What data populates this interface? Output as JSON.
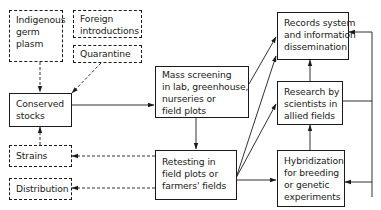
{
  "diagram": {
    "type": "flowchart",
    "nodes": {
      "indigenous": {
        "style": "dashed",
        "lines": [
          "Indigenous",
          "germ",
          "plasm"
        ]
      },
      "foreign": {
        "style": "dashed",
        "lines": [
          "Foreign",
          "introductions"
        ]
      },
      "quarantine": {
        "style": "dashed",
        "lines": [
          "Quarantine"
        ]
      },
      "conserved": {
        "style": "solid",
        "lines": [
          "Conserved",
          "stocks"
        ]
      },
      "strains": {
        "style": "dashed",
        "lines": [
          "Strains"
        ]
      },
      "distribution": {
        "style": "dashed",
        "lines": [
          "Distribution"
        ]
      },
      "mass_screening": {
        "style": "solid",
        "lines": [
          "Mass screening",
          "in lab, greenhouse,",
          "nurseries or",
          "field plots"
        ]
      },
      "retesting": {
        "style": "solid",
        "lines": [
          "Retesting in",
          "field plots or",
          "farmers' fields"
        ]
      },
      "records": {
        "style": "solid",
        "lines": [
          "Records system",
          "and information",
          "dissemination"
        ]
      },
      "research": {
        "style": "solid",
        "lines": [
          "Research by",
          "scientists in",
          "allied fields"
        ]
      },
      "hybridization": {
        "style": "solid",
        "lines": [
          "Hybridization",
          "for breeding",
          "or genetic",
          "experiments"
        ]
      }
    },
    "edges": [
      {
        "from": "indigenous",
        "to": "conserved",
        "style": "dashed"
      },
      {
        "from": "quarantine",
        "to": "conserved",
        "style": "dashed"
      },
      {
        "from": "strains",
        "to": "conserved",
        "style": "dashed"
      },
      {
        "from": "conserved",
        "to": "mass_screening",
        "style": "solid"
      },
      {
        "from": "mass_screening",
        "to": "retesting",
        "style": "solid"
      },
      {
        "from": "mass_screening",
        "to": "records",
        "style": "solid"
      },
      {
        "from": "retesting",
        "to": "records",
        "style": "solid"
      },
      {
        "from": "retesting",
        "to": "research",
        "style": "solid"
      },
      {
        "from": "retesting",
        "to": "hybridization",
        "style": "solid"
      },
      {
        "from": "retesting",
        "to": "strains",
        "style": "dashed"
      },
      {
        "from": "retesting",
        "to": "distribution",
        "style": "dashed"
      },
      {
        "from": "hybridization",
        "to": "research",
        "style": "solid"
      },
      {
        "from": "research",
        "to": "records",
        "style": "solid"
      },
      {
        "from": "research",
        "to": "records",
        "style": "solid",
        "route": "right-side loop"
      },
      {
        "from": "research",
        "to": "hybridization",
        "style": "solid",
        "route": "right-side loop"
      }
    ],
    "colors": {
      "ink": "#1a1a1a",
      "background": "#ffffff"
    }
  }
}
